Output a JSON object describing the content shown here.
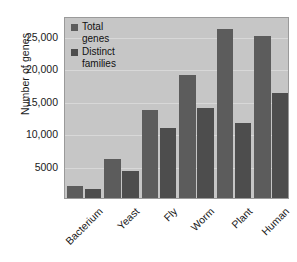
{
  "chart_data": {
    "type": "bar",
    "title": "",
    "xlabel": "",
    "ylabel": "Number of genes",
    "categories": [
      "Bacterium",
      "Yeast",
      "Fly",
      "Worm",
      "Plant",
      "Human"
    ],
    "series": [
      {
        "name": "Total\ngenes",
        "legend_label": "Total genes",
        "color": "#5c5c5c",
        "values": [
          1800,
          6000,
          13500,
          19000,
          26000,
          25000
        ]
      },
      {
        "name": "Distinct\nfamilies",
        "legend_label": "Distinct families",
        "color": "#4d4d4d",
        "values": [
          1400,
          4200,
          10700,
          13800,
          11600,
          16200
        ]
      }
    ],
    "ylim": [
      0,
      28000
    ],
    "yticks": [
      5000,
      10000,
      15000,
      20000,
      25000
    ],
    "ytick_labels": [
      "5000",
      "10,000",
      "15,000",
      "20,000",
      "25,000"
    ],
    "grid": true,
    "legend_position": "top-left",
    "plot_background": "#c6c6c6"
  }
}
